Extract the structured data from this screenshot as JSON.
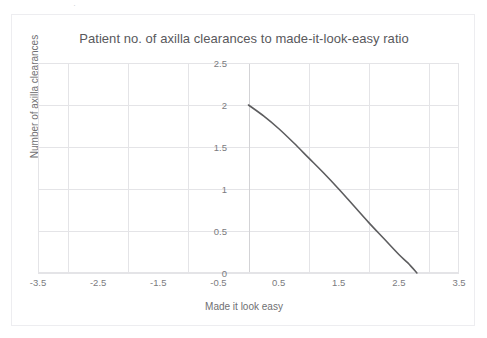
{
  "chart_data": {
    "type": "line",
    "title": "Patient no. of axilla clearances to made-it-look-easy ratio",
    "xlabel": "Made it look easy",
    "ylabel": "Number of axilla clearances",
    "xlim": [
      -3.5,
      3.5
    ],
    "ylim": [
      0,
      2.5
    ],
    "xticks": [
      "-3.5",
      "-2.5",
      "-1.5",
      "-0.5",
      "0.5",
      "1.5",
      "2.5",
      "3.5"
    ],
    "xtick_values": [
      -3.5,
      -2.5,
      -1.5,
      -0.5,
      0.5,
      1.5,
      2.5,
      3.5
    ],
    "yticks": [
      "0",
      "0.5",
      "1",
      "1.5",
      "2",
      "2.5"
    ],
    "ytick_values": [
      0,
      0.5,
      1,
      1.5,
      2,
      2.5
    ],
    "grid": true,
    "legend": false,
    "legend_position": "none",
    "series": [
      {
        "name": "axilla clearance ratio",
        "color": "#5d5d5f",
        "x": [
          0,
          0.25,
          0.5,
          0.75,
          1,
          1.25,
          1.5,
          1.75,
          2,
          2.25,
          2.5,
          2.65,
          2.8
        ],
        "values": [
          2,
          1.87,
          1.72,
          1.55,
          1.37,
          1.19,
          1.0,
          0.8,
          0.6,
          0.41,
          0.22,
          0.12,
          0.0
        ]
      }
    ]
  },
  "annotations": {
    "scan_artifact": "·"
  }
}
